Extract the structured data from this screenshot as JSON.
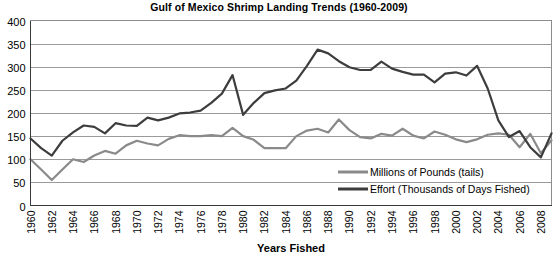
{
  "chart_data": {
    "type": "line",
    "title": "Gulf of Mexico Shrimp Landing Trends (1960-2009)",
    "xlabel": "Years Fished",
    "ylabel": "",
    "ylim": [
      0,
      400
    ],
    "ytick_step": 50,
    "yticks": [
      "0",
      "50",
      "100",
      "150",
      "200",
      "250",
      "300",
      "350",
      "400"
    ],
    "xlim": [
      1960,
      2009
    ],
    "xticks": [
      "1960",
      "1962",
      "1964",
      "1966",
      "1968",
      "1970",
      "1972",
      "1974",
      "1976",
      "1978",
      "1980",
      "1982",
      "1984",
      "1986",
      "1988",
      "1990",
      "1992",
      "1994",
      "1996",
      "1998",
      "2000",
      "2002",
      "2004",
      "2006",
      "2008"
    ],
    "xtick_step": 2,
    "xtick_rotation": 90,
    "grid": "horizontal",
    "legend_position": "inside-bottom-right",
    "x": [
      1960,
      1961,
      1962,
      1963,
      1964,
      1965,
      1966,
      1967,
      1968,
      1969,
      1970,
      1971,
      1972,
      1973,
      1974,
      1975,
      1976,
      1977,
      1978,
      1979,
      1980,
      1981,
      1982,
      1983,
      1984,
      1985,
      1986,
      1987,
      1988,
      1989,
      1990,
      1991,
      1992,
      1993,
      1994,
      1995,
      1996,
      1997,
      1998,
      1999,
      2000,
      2001,
      2002,
      2003,
      2004,
      2005,
      2006,
      2007,
      2008,
      2009
    ],
    "series": [
      {
        "name": "Millions of Pounds (tails)",
        "color": "#8a8a8a",
        "values": [
          100,
          78,
          55,
          78,
          100,
          94,
          108,
          118,
          112,
          130,
          140,
          134,
          130,
          144,
          152,
          150,
          150,
          152,
          150,
          168,
          150,
          142,
          124,
          124,
          124,
          150,
          162,
          166,
          158,
          186,
          163,
          148,
          145,
          155,
          151,
          166,
          151,
          145,
          160,
          153,
          143,
          137,
          143,
          153,
          156,
          153,
          126,
          155,
          113,
          141
        ]
      },
      {
        "name": "Effort (Thousands of Days Fished)",
        "color": "#3d3d3d",
        "values": [
          145,
          124,
          108,
          140,
          158,
          173,
          170,
          156,
          178,
          173,
          172,
          190,
          184,
          190,
          199,
          201,
          205,
          222,
          242,
          282,
          196,
          222,
          243,
          249,
          253,
          270,
          302,
          337,
          329,
          312,
          299,
          293,
          293,
          311,
          296,
          289,
          283,
          283,
          266,
          285,
          288,
          281,
          302,
          253,
          184,
          148,
          161,
          126,
          104,
          156
        ]
      }
    ]
  }
}
